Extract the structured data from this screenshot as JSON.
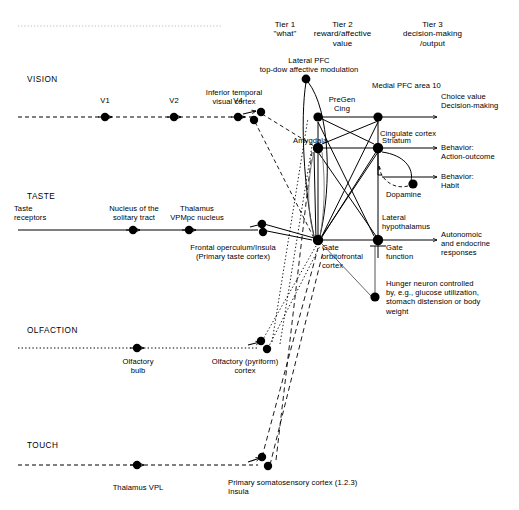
{
  "figure": {
    "type": "diagram",
    "title_tiers": [
      {
        "id": "tier1",
        "line1": "Tier 1",
        "line2": "\"what\""
      },
      {
        "id": "tier2",
        "line1": "Tier 2",
        "line2": "reward/affective",
        "line3": "value"
      },
      {
        "id": "tier3",
        "line1": "Tier 3",
        "line2": "decision-making",
        "line3": "/output"
      }
    ],
    "modalities": [
      {
        "id": "vision",
        "label": "VISION"
      },
      {
        "id": "taste",
        "label": "TASTE"
      },
      {
        "id": "olfaction",
        "label": "OLFACTION"
      },
      {
        "id": "touch",
        "label": "TOUCH"
      }
    ],
    "nodes": {
      "v1": "V1",
      "v2": "V2",
      "v4": "V4",
      "it": "Inferior temporal\nvisual cortex",
      "lateral_pfc": "Lateral PFC\ntop-dow affective modulation",
      "pregen_cing": "PreGen\nCing",
      "medial_pfc": "Medial PFC area 10",
      "cingulate": "Cingulate cortex",
      "amygdala": "Amygdala",
      "striatum": "Striatum",
      "dopamine": "Dopamine",
      "lateral_hypothalamus": "Lateral\nhypothalamus",
      "gate_function": "Gate\nfunction",
      "ofc": "Gate\norbitofrontal\ncortex",
      "taste_receptors": "Taste\nreceptors",
      "nts": "Nucleus of the\nsolitary tract",
      "thalamus_vpmpc": "Thalamus\nVPMpc nucleus",
      "frontal_operculum": "Frontal operculum/Insula\n(Primary taste cortex)",
      "olfactory_bulb": "Olfactory\nbulb",
      "pyriform": "Olfactory (pyriform)\ncortex",
      "thalamus_vpl": "Thalamus VPL",
      "somatosensory": "Primary somatosensory cortex (1.2.3)\nInsula",
      "hunger_neuron": "Hunger neuron controlled\nby, e.g., glucose utilization,\nstomach distension or body\nweight"
    },
    "outputs": [
      {
        "id": "choice_value",
        "text": "Choice value\nDecision-making"
      },
      {
        "id": "action_outcome",
        "text": "Behavior:\nAction-outcome"
      },
      {
        "id": "habit",
        "text": "Behavior:\nHabit"
      },
      {
        "id": "autonomic",
        "text": "Autonomoic\nand endocrine\nresponses"
      }
    ],
    "colors": {
      "ink": "#000000",
      "line": "#1a1a1a",
      "faint": "#9a9a9a"
    }
  }
}
